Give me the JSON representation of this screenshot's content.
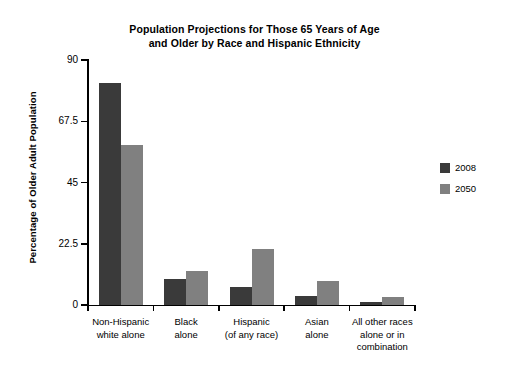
{
  "chart_data": {
    "type": "bar",
    "title": "Population Projections for Those 65 Years of Age and Older by Race and Hispanic Ethnicity",
    "title_line1": "Population Projections for Those 65 Years of Age",
    "title_line2": "and Older by Race and Hispanic Ethnicity",
    "xlabel": "",
    "ylabel": "Percentage of Older Adult Population",
    "ylim": [
      0,
      90
    ],
    "yticks": [
      0,
      22.5,
      45,
      67.5,
      90
    ],
    "ytick_labels": [
      "0",
      "22.5",
      "45",
      "67.5",
      "90"
    ],
    "grid": false,
    "legend_position": "right",
    "categories": [
      "Non-Hispanic white alone",
      "Black alone",
      "Hispanic (of any race)",
      "Asian alone",
      "All other races alone or in combination"
    ],
    "category_label_lines": [
      [
        "Non-Hispanic",
        "white alone"
      ],
      [
        "Black",
        "alone"
      ],
      [
        "Hispanic",
        "(of any race)"
      ],
      [
        "Asian",
        "alone"
      ],
      [
        "All other races",
        "alone or in",
        "combination"
      ]
    ],
    "series": [
      {
        "name": "2008",
        "color": "#3a3a3a",
        "values": [
          81.6,
          9.5,
          6.8,
          3.2,
          1.1
        ]
      },
      {
        "name": "2050",
        "color": "#808080",
        "values": [
          58.8,
          12.5,
          20.6,
          8.9,
          3.0
        ]
      }
    ]
  },
  "legend": {
    "items": [
      {
        "label": "2008",
        "color": "#3a3a3a"
      },
      {
        "label": "2050",
        "color": "#808080"
      }
    ]
  }
}
